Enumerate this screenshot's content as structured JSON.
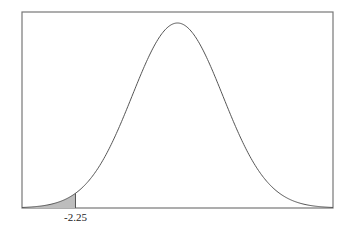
{
  "chart_data": {
    "type": "area",
    "title": "",
    "xlabel": "",
    "ylabel": "",
    "distribution": "standard normal",
    "mean": 0,
    "sd": 1,
    "xlim": [
      -3.43,
      3.43
    ],
    "shaded_region": {
      "from": -3.43,
      "to": -2.25,
      "side": "left"
    },
    "annotations": [
      {
        "x": -2.25,
        "text": "-2.25"
      }
    ],
    "grid": false,
    "legend": null
  },
  "colors": {
    "curve": "#555555",
    "fill": "#bdbdbd",
    "frame": "#777777"
  }
}
